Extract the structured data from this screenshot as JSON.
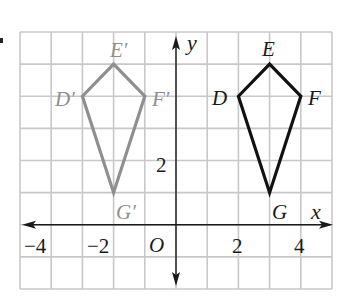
{
  "diagram": {
    "type": "coordinate-plane-translation",
    "grid": {
      "x_min": -5,
      "x_max": 5,
      "y_min": -2,
      "y_max": 6,
      "color": "#c8c8c8"
    },
    "axes": {
      "x_label": "x",
      "y_label": "y",
      "origin_label": "O",
      "x_ticks": [
        {
          "value": -4,
          "label": "−4"
        },
        {
          "value": -2,
          "label": "−2"
        },
        {
          "value": 2,
          "label": "2"
        },
        {
          "value": 4,
          "label": "4"
        }
      ],
      "y_ticks": [
        {
          "value": 2,
          "label": "2"
        }
      ],
      "color": "#1a1a1a"
    },
    "figures": [
      {
        "name": "DEFG",
        "role": "preimage",
        "color": "#111111",
        "vertices": [
          {
            "label": "D",
            "x": 2,
            "y": 4
          },
          {
            "label": "E",
            "x": 3,
            "y": 5
          },
          {
            "label": "F",
            "x": 4,
            "y": 4
          },
          {
            "label": "G",
            "x": 3,
            "y": 1
          }
        ]
      },
      {
        "name": "D'E'F'G'",
        "role": "image",
        "color": "#8f8f8f",
        "vertices": [
          {
            "label": "D′",
            "x": -3,
            "y": 4
          },
          {
            "label": "E′",
            "x": -2,
            "y": 5
          },
          {
            "label": "F′",
            "x": -1,
            "y": 4
          },
          {
            "label": "G′",
            "x": -2,
            "y": 1
          }
        ]
      }
    ]
  },
  "labels": {
    "x_axis": "x",
    "y_axis": "y",
    "origin": "O",
    "tick_x_neg4": "−4",
    "tick_x_neg2": "−2",
    "tick_x_2": "2",
    "tick_x_4": "4",
    "tick_y_2": "2",
    "D": "D",
    "E": "E",
    "F": "F",
    "G": "G",
    "D_prime": "D′",
    "E_prime": "E′",
    "F_prime": "F′",
    "G_prime": "G′"
  }
}
